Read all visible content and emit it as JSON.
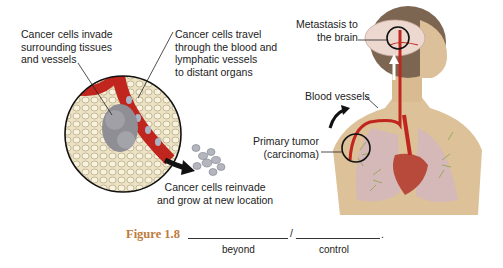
{
  "labels": {
    "invade": "Cancer cells invade\nsurrounding tissues\nand vessels",
    "travel": "Cancer cells travel\nthrough the blood and\nlymphatic vessels\nto distant organs",
    "reinvade": "Cancer cells reinvade\nand grow at new location",
    "metastasis": "Metastasis to\nthe brain",
    "blood_vessels": "Blood vessels",
    "primary_tumor": "Primary tumor\n(carcinoma)"
  },
  "caption": {
    "figure": "Figure 1.8",
    "slash": "/",
    "period": ".",
    "word1": "beyond",
    "word2": "control",
    "color": "#c07a3a"
  },
  "colors": {
    "vessel": "#c0261d",
    "tissue": "#e9dfc4",
    "skin": "#d9b98c",
    "hair": "#8a7258",
    "lung": "#d8b9bf"
  }
}
